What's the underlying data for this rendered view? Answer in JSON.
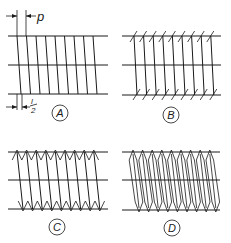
{
  "diagram": {
    "panels": [
      {
        "id": "A",
        "label": "A",
        "style": "single",
        "x0": 8,
        "x1": 108,
        "top": 36,
        "mid": 65,
        "bot": 94,
        "first": 17,
        "pitch": 9.5,
        "count": 9,
        "shift": 4,
        "cx": 60,
        "cy": 113
      },
      {
        "id": "B",
        "label": "B",
        "style": "ticks",
        "x0": 122,
        "x1": 221,
        "top": 36,
        "mid": 65,
        "bot": 95,
        "first": 134,
        "pitch": 9.6,
        "count": 9,
        "shift": 3,
        "cx": 171,
        "cy": 115
      },
      {
        "id": "C",
        "label": "C",
        "style": "zigzag",
        "x0": 8,
        "x1": 108,
        "top": 152,
        "mid": 180,
        "bot": 209,
        "first": 17,
        "pitch": 9.6,
        "count": 9,
        "shift": 6,
        "cx": 57,
        "cy": 227
      },
      {
        "id": "D",
        "label": "D",
        "style": "double",
        "x0": 122,
        "x1": 220,
        "top": 152,
        "mid": 180,
        "bot": 210,
        "first": 133,
        "pitch": 9.6,
        "count": 9,
        "shift": 6,
        "cx": 172,
        "cy": 228
      }
    ],
    "annotations": {
      "pitch_label": "p",
      "half_lead_num": "l",
      "half_lead_den": "2"
    }
  }
}
